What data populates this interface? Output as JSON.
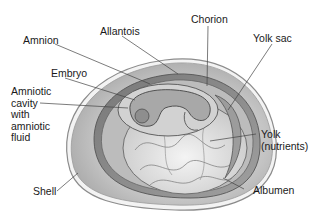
{
  "diagram": {
    "labels": {
      "allantois": "Allantois",
      "chorion": "Chorion",
      "amnion": "Amnion",
      "yolk_sac": "Yolk sac",
      "embryo": "Embryo",
      "amniotic_cavity": "Amniotic\ncavity\nwith\namniotic\nfluid",
      "yolk": "Yolk\n(nutrients)",
      "shell": "Shell",
      "albumen": "Albumen"
    },
    "colors": {
      "line": "#444444",
      "shell": "#bdbdbd",
      "albumen": "#c8c8c8",
      "chorion": "#8a8a8a",
      "yolk": "#e2e2e2",
      "embryo": "#a8a8a8"
    }
  }
}
